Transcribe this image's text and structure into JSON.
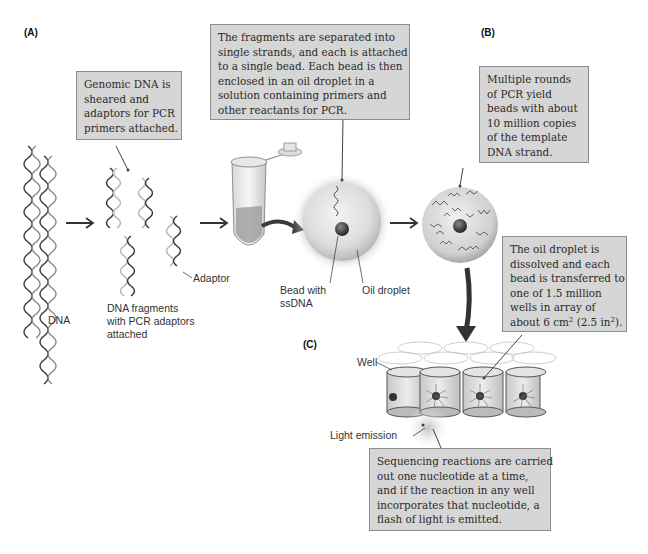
{
  "panels": {
    "a": "(A)",
    "b": "(B)",
    "c": "(C)"
  },
  "callouts": {
    "genomic": [
      "Genomic DNA is",
      "sheared and",
      "adaptors for PCR",
      "primers attached."
    ],
    "fragments": [
      "The fragments are separated into",
      "single strands, and each is attached",
      "to a single bead. Each bead is then",
      "enclosed in an oil droplet in a",
      "solution containing primers and",
      "other reactants for PCR."
    ],
    "pcr": [
      "Multiple rounds",
      "of PCR yield",
      "beads with about",
      "10 million copies",
      "of the template",
      "DNA strand."
    ],
    "oil": [
      "The oil droplet is",
      "dissolved and each",
      "bead is transferred to",
      "one of 1.5 million",
      "wells in array of"
    ],
    "oil_last": {
      "pre": "about 6 cm",
      "sup1": "2",
      "mid": " (2.5 in",
      "sup2": "2",
      "post": ")."
    },
    "sequencing": [
      "Sequencing reactions are carried",
      "out one nucleotide at a time,",
      "and if the reaction in any well",
      "incorporates that nucleotide, a",
      "flash of light is emitted."
    ]
  },
  "labels": {
    "dna": "DNA",
    "fragments": [
      "DNA fragments",
      "with PCR adaptors",
      "attached"
    ],
    "adaptor": "Adaptor",
    "bead": [
      "Bead with",
      "ssDNA"
    ],
    "oil_droplet": "Oil droplet",
    "well": "Well",
    "light_emission": "Light emission"
  },
  "colors": {
    "callout_bg": "#d6d6d6",
    "callout_border": "#8c8c8c",
    "dna_dark": "#3a3a3a",
    "dna_light": "#b5b5b5",
    "arrow": "#333333"
  }
}
